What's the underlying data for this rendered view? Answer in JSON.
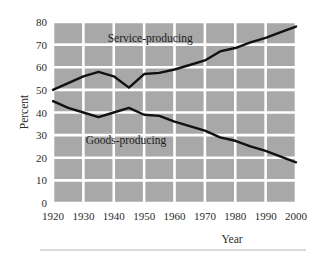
{
  "figure": {
    "background_color": "#ffffff",
    "plot_background_color": "#a8a8a8",
    "gridline_color": "#ffffff",
    "line_color": "#111111",
    "footer_rule_color": "#b6b6b6"
  },
  "chart_data": {
    "type": "line",
    "title": "",
    "subtitle": "",
    "xlabel": "Year",
    "ylabel": "Percent",
    "xlim": [
      1920,
      2000
    ],
    "ylim": [
      0,
      80
    ],
    "xticks": [
      1920,
      1930,
      1940,
      1950,
      1960,
      1970,
      1980,
      1990,
      2000
    ],
    "xtick_labels": [
      "1920",
      "1930",
      "1940",
      "1950",
      "1960",
      "1970",
      "1980",
      "1990",
      "2000"
    ],
    "yticks": [
      0,
      10,
      20,
      30,
      40,
      50,
      60,
      70,
      80
    ],
    "ytick_labels": [
      "0",
      "10",
      "20",
      "30",
      "40",
      "50",
      "60",
      "70",
      "80"
    ],
    "grid": true,
    "grid_color": "#ffffff",
    "legend_position": "inline-annotation",
    "series": [
      {
        "name": "Service-producing",
        "color": "#111111",
        "x": [
          1920,
          1925,
          1930,
          1935,
          1940,
          1945,
          1950,
          1955,
          1960,
          1965,
          1970,
          1975,
          1980,
          1985,
          1990,
          1995,
          2000
        ],
        "values": [
          50,
          53,
          56,
          58,
          56,
          51,
          57,
          57.5,
          59,
          61,
          63,
          67,
          68.5,
          71,
          73,
          75.5,
          78
        ]
      },
      {
        "name": "Goods-producing",
        "color": "#111111",
        "x": [
          1920,
          1925,
          1930,
          1935,
          1940,
          1945,
          1950,
          1955,
          1960,
          1965,
          1970,
          1975,
          1980,
          1985,
          1990,
          1995,
          2000
        ],
        "values": [
          45,
          42,
          40,
          38,
          40,
          42,
          39,
          38.5,
          36,
          34,
          32,
          29,
          27.5,
          25,
          23,
          20.5,
          18
        ]
      }
    ],
    "annotations": [
      {
        "text": "Service-producing",
        "x": 1952,
        "y": 71
      },
      {
        "text": "Goods-producing",
        "x": 1944,
        "y": 26
      }
    ]
  }
}
